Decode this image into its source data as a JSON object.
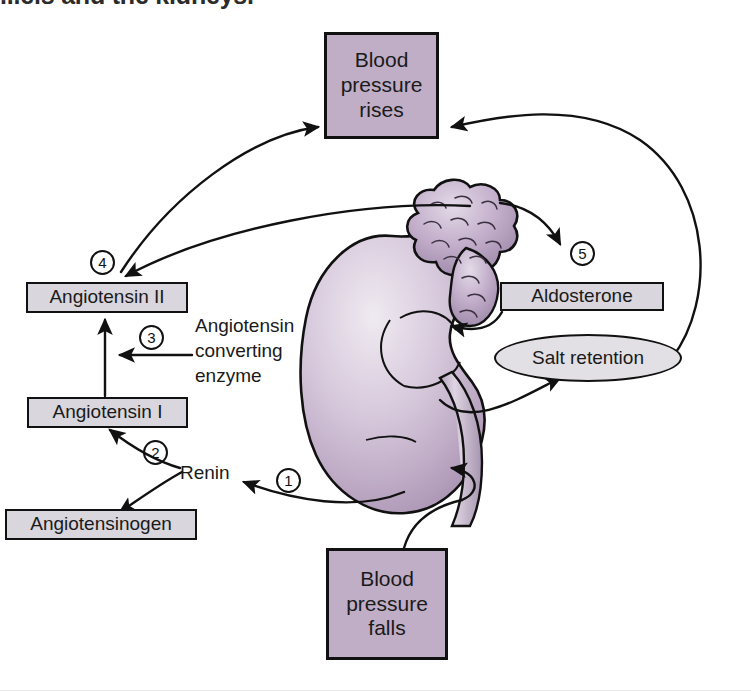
{
  "caption": {
    "text": "...els and the kidneys."
  },
  "diagram": {
    "nodes": {
      "bp_rises": "Blood\npressure\nrises",
      "bp_falls": "Blood\npressure\nfalls",
      "angiotensin_2": "Angiotensin II",
      "angiotensin_1": "Angiotensin I",
      "angiotensinogen": "Angiotensinogen",
      "aldosterone": "Aldosterone",
      "salt_retention": "Salt retention"
    },
    "labels": {
      "ace": "Angiotensin\nconverting\nenzyme",
      "renin": "Renin"
    },
    "steps": {
      "one": "1",
      "two": "2",
      "three": "3",
      "four": "4",
      "five": "5"
    },
    "illustration": {
      "kidney": "kidney",
      "adrenal_gland": "adrenal-gland"
    },
    "colors": {
      "box_purple": "#c0aec7",
      "box_gray": "#d9d6dd",
      "ellipse_gray": "#e2e0e4",
      "outline": "#111111",
      "kidney_light": "#e6dfe9",
      "kidney_mid": "#c8b7ce",
      "kidney_dark": "#9d89a8",
      "page_background": "#ffffff"
    }
  }
}
